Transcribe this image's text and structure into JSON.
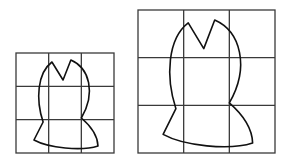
{
  "figure": {
    "grids": [
      {
        "name": "small-grid",
        "rows": 3,
        "cols": 3
      },
      {
        "name": "large-grid",
        "rows": 3,
        "cols": 3
      }
    ],
    "shape_points_grid_units": {
      "left_peak": [
        1.1,
        0.27
      ],
      "notch": [
        1.44,
        0.81
      ],
      "right_peak": [
        1.68,
        0.21
      ],
      "right_waist": [
        2.0,
        1.95
      ],
      "bottom_right": [
        2.51,
        2.79
      ],
      "bottom_left": [
        0.55,
        2.61
      ],
      "left_waist": [
        0.83,
        2.07
      ]
    },
    "colors": {
      "line": "#111111",
      "grid": "#3a3a3a",
      "background": "#ffffff"
    }
  }
}
